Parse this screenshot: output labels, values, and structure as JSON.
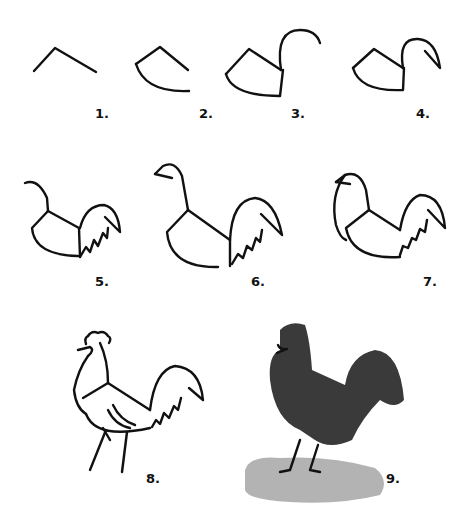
{
  "steps": [
    {
      "label": "1.",
      "description": "Draw an angled line for the back"
    },
    {
      "label": "2.",
      "description": "Add a curved belly line"
    },
    {
      "label": "3.",
      "description": "Draw the neck curve"
    },
    {
      "label": "4.",
      "description": "Add the beak"
    },
    {
      "label": "5.",
      "description": "Add the tail feathers"
    },
    {
      "label": "6.",
      "description": "Refine the head and neck"
    },
    {
      "label": "7.",
      "description": "Draw the front of the neck and breast"
    },
    {
      "label": "8.",
      "description": "Add comb, wing lines and legs"
    },
    {
      "label": "9.",
      "description": "Ink wash shading and ground"
    }
  ],
  "colors": {
    "ink": "#111111",
    "wash_dark": "#3a3a3a",
    "wash_light": "#9a9a9a",
    "background": "#ffffff"
  }
}
